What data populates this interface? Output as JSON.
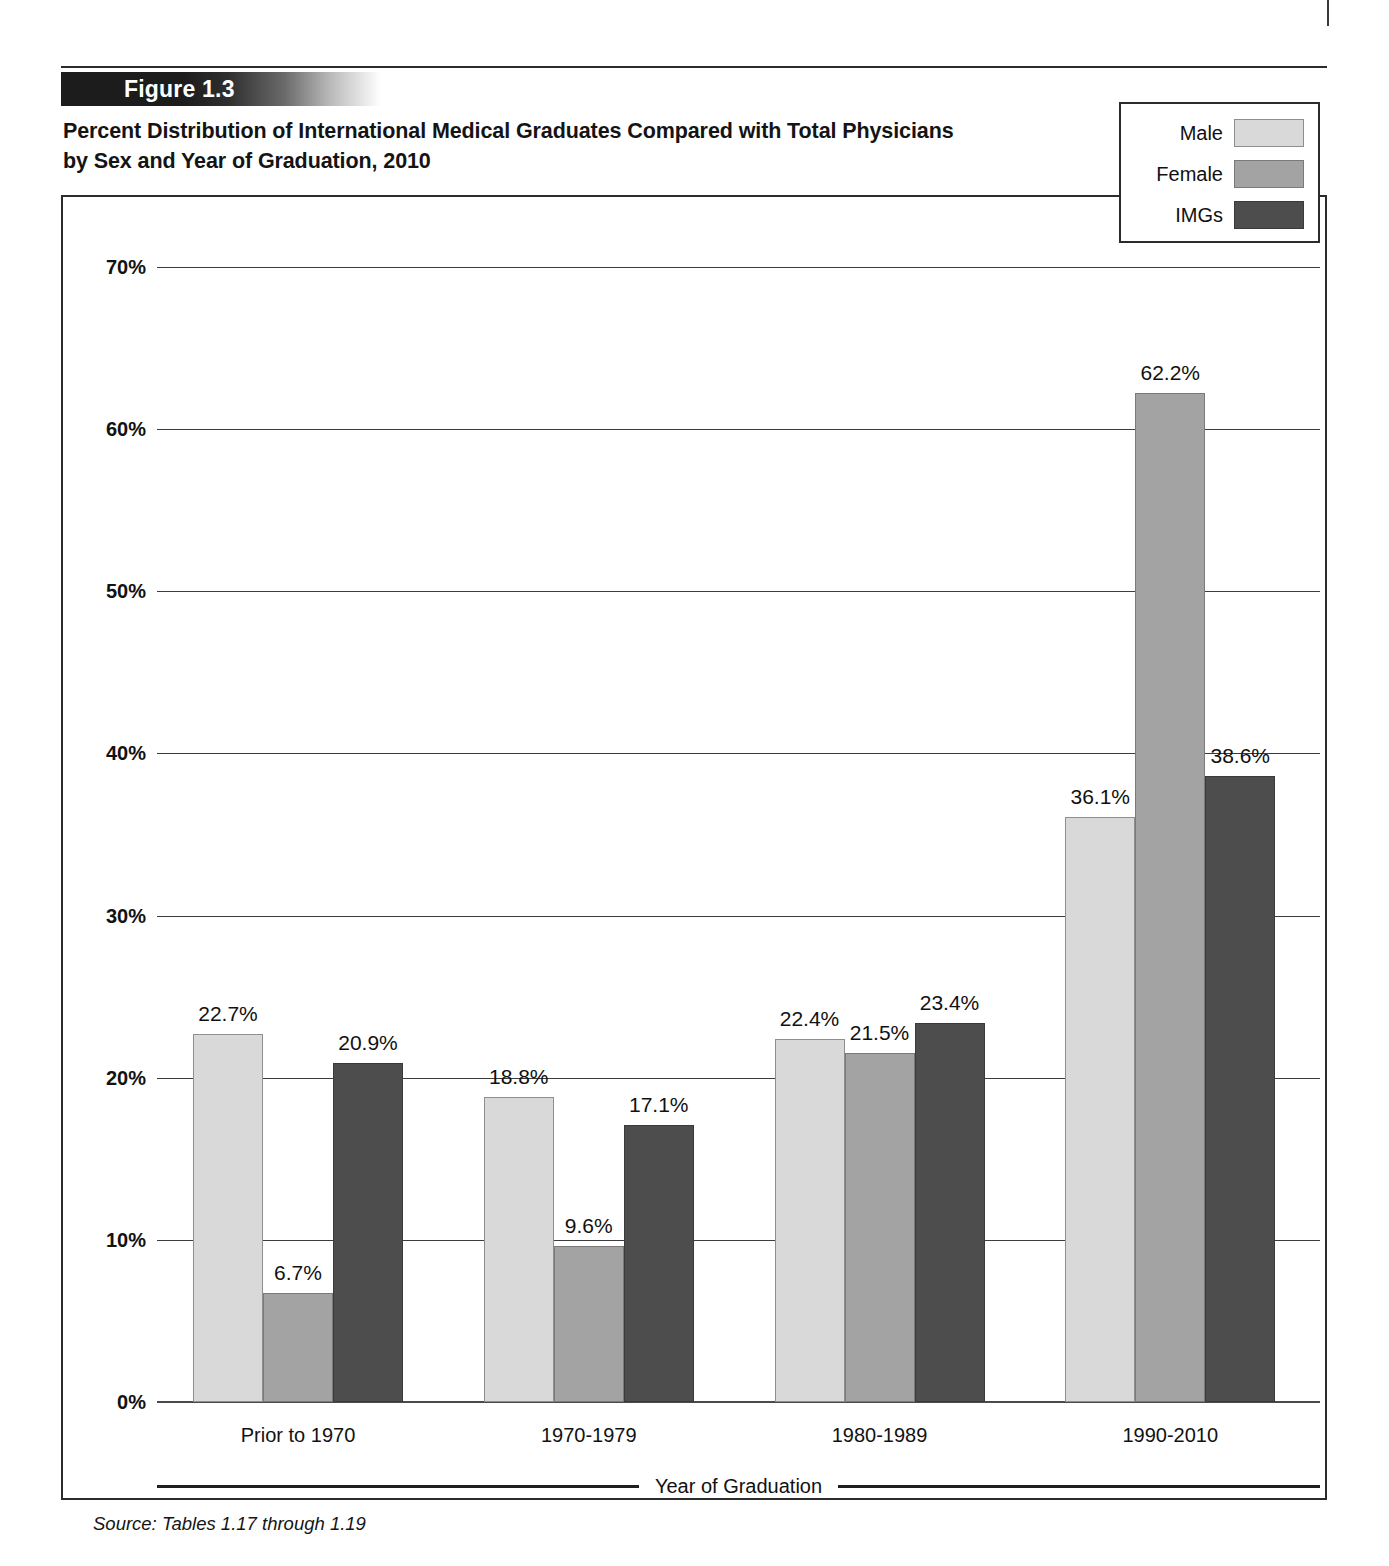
{
  "page": {
    "header_smudge": ""
  },
  "figure": {
    "banner_label": "Figure 1.3",
    "title_line1": "Percent Distribution of International Medical Graduates Compared with Total Physicians",
    "title_line2": "by Sex and Year of Graduation, 2010",
    "source_note": "Source: Tables 1.17 through 1.19"
  },
  "legend": {
    "items": [
      {
        "label": "Male",
        "color": "#d9d9d9",
        "key": "male"
      },
      {
        "label": "Female",
        "color": "#a3a3a3",
        "key": "female"
      },
      {
        "label": "IMGs",
        "color": "#4d4d4d",
        "key": "imgs"
      }
    ]
  },
  "chart_data": {
    "type": "bar",
    "title": "Percent Distribution of International Medical Graduates Compared with Total Physicians by Sex and Year of Graduation, 2010",
    "xlabel": "Year of Graduation",
    "ylabel": "",
    "ylim": [
      0,
      70
    ],
    "ytick_labels": [
      "0%",
      "10%",
      "20%",
      "30%",
      "40%",
      "50%",
      "60%",
      "70%"
    ],
    "ytick_values": [
      0,
      10,
      20,
      30,
      40,
      50,
      60,
      70
    ],
    "grid": true,
    "legend_position": "top-right",
    "categories": [
      "Prior to 1970",
      "1970-1979",
      "1980-1989",
      "1990-2010"
    ],
    "series": [
      {
        "name": "Male",
        "color": "#d9d9d9",
        "key": "male",
        "values": [
          22.7,
          18.8,
          22.4,
          36.1
        ],
        "labels": [
          "22.7%",
          "18.8%",
          "22.4%",
          "36.1%"
        ]
      },
      {
        "name": "Female",
        "color": "#a3a3a3",
        "key": "female",
        "values": [
          6.7,
          9.6,
          21.5,
          62.2
        ],
        "labels": [
          "6.7%",
          "9.6%",
          "21.5%",
          "62.2%"
        ]
      },
      {
        "name": "IMGs",
        "color": "#4d4d4d",
        "key": "imgs",
        "values": [
          20.9,
          17.1,
          23.4,
          38.6
        ],
        "labels": [
          "20.9%",
          "17.1%",
          "23.4%",
          "38.6%"
        ]
      }
    ]
  }
}
